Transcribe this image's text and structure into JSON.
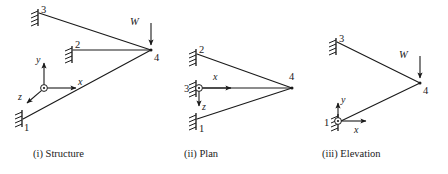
{
  "figure": {
    "colors": {
      "line": "#1a1a1a",
      "background": "#ffffff"
    }
  },
  "panels": {
    "structure": {
      "caption": "(i) Structure",
      "nodes": {
        "n1": "1",
        "n2": "2",
        "n3": "3",
        "n4": "4"
      },
      "load_label": "W",
      "axes": {
        "x": "x",
        "y": "y",
        "z": "z"
      }
    },
    "plan": {
      "caption": "(ii) Plan",
      "nodes": {
        "n1": "1",
        "n2": "2",
        "n3": "3",
        "n4": "4"
      },
      "axes": {
        "x": "x",
        "z": "z"
      }
    },
    "elevation": {
      "caption": "(iii) Elevation",
      "nodes": {
        "n1": "1",
        "n3": "3",
        "n4": "4"
      },
      "load_label": "W",
      "axes": {
        "x": "x",
        "y": "y"
      }
    }
  }
}
